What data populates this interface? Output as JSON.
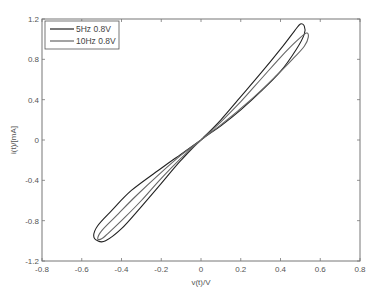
{
  "chart_data": {
    "type": "line",
    "title": "",
    "xlabel": "v(t)/V",
    "ylabel": "i(t)/[mA]",
    "xlim": [
      -0.8,
      0.8
    ],
    "ylim": [
      -1.2,
      1.2
    ],
    "xticks": [
      -0.8,
      -0.6,
      -0.4,
      -0.2,
      0,
      0.2,
      0.4,
      0.6,
      0.8
    ],
    "xtick_labels": [
      "-0.8",
      "-0.6",
      "-0.4",
      "-0.2",
      "0",
      "0.2",
      "0.4",
      "0.6",
      "0.8"
    ],
    "yticks": [
      1.2,
      0.8,
      0.4,
      0,
      -0.4,
      -0.8,
      -1.2
    ],
    "ytick_labels": [
      "1.2",
      "0.8",
      "0.4",
      "0",
      "-0.4",
      "-0.8",
      "-1.2"
    ],
    "grid": false,
    "legend_position": "upper left",
    "series": [
      {
        "name": "5Hz 0.8V",
        "color": "#222222",
        "points": [
          [
            0,
            0
          ],
          [
            0.1,
            0.2
          ],
          [
            0.2,
            0.43
          ],
          [
            0.3,
            0.66
          ],
          [
            0.4,
            0.9
          ],
          [
            0.47,
            1.08
          ],
          [
            0.5,
            1.15
          ],
          [
            0.52,
            1.13
          ],
          [
            0.52,
            1.05
          ],
          [
            0.48,
            0.9
          ],
          [
            0.4,
            0.68
          ],
          [
            0.3,
            0.48
          ],
          [
            0.2,
            0.3
          ],
          [
            0.1,
            0.14
          ],
          [
            0,
            0
          ],
          [
            -0.1,
            -0.2
          ],
          [
            -0.2,
            -0.43
          ],
          [
            -0.3,
            -0.66
          ],
          [
            -0.4,
            -0.88
          ],
          [
            -0.48,
            -1.0
          ],
          [
            -0.52,
            -1.0
          ],
          [
            -0.54,
            -0.95
          ],
          [
            -0.52,
            -0.85
          ],
          [
            -0.45,
            -0.7
          ],
          [
            -0.35,
            -0.5
          ],
          [
            -0.2,
            -0.28
          ],
          [
            -0.1,
            -0.14
          ],
          [
            0,
            0
          ]
        ]
      },
      {
        "name": "10Hz 0.8V",
        "color": "#666666",
        "points": [
          [
            0,
            0
          ],
          [
            0.1,
            0.18
          ],
          [
            0.2,
            0.38
          ],
          [
            0.3,
            0.6
          ],
          [
            0.4,
            0.82
          ],
          [
            0.48,
            0.98
          ],
          [
            0.53,
            1.06
          ],
          [
            0.54,
            1.02
          ],
          [
            0.52,
            0.93
          ],
          [
            0.46,
            0.8
          ],
          [
            0.38,
            0.64
          ],
          [
            0.28,
            0.45
          ],
          [
            0.18,
            0.28
          ],
          [
            0.08,
            0.12
          ],
          [
            0,
            0
          ],
          [
            -0.1,
            -0.18
          ],
          [
            -0.2,
            -0.38
          ],
          [
            -0.3,
            -0.6
          ],
          [
            -0.4,
            -0.8
          ],
          [
            -0.47,
            -0.93
          ],
          [
            -0.5,
            -0.98
          ],
          [
            -0.52,
            -0.98
          ],
          [
            -0.5,
            -0.9
          ],
          [
            -0.43,
            -0.76
          ],
          [
            -0.33,
            -0.56
          ],
          [
            -0.2,
            -0.32
          ],
          [
            -0.1,
            -0.15
          ],
          [
            0,
            0
          ]
        ]
      }
    ]
  }
}
